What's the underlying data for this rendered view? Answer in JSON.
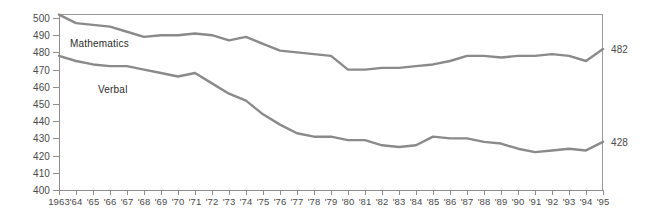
{
  "chart_data": {
    "type": "line",
    "title": "",
    "subtitle": "",
    "xlabel": "",
    "ylabel": "",
    "grid": false,
    "legend_position": "inline-labels",
    "ylim": [
      400,
      505
    ],
    "y_ticks": [
      400,
      410,
      420,
      430,
      440,
      450,
      460,
      470,
      480,
      490,
      500
    ],
    "x": [
      1963,
      1964,
      1965,
      1966,
      1967,
      1968,
      1969,
      1970,
      1971,
      1972,
      1973,
      1974,
      1975,
      1976,
      1977,
      1978,
      1979,
      1980,
      1981,
      1982,
      1983,
      1984,
      1985,
      1986,
      1987,
      1988,
      1989,
      1990,
      1991,
      1992,
      1993,
      1994,
      1995
    ],
    "x_tick_labels": [
      "1963",
      "'64",
      "'65",
      "'66",
      "'67",
      "'68",
      "'69",
      "'70",
      "'71",
      "'72",
      "'73",
      "'74",
      "'75",
      "'76",
      "'77",
      "'78",
      "'79",
      "'80",
      "'81",
      "'82",
      "'83",
      "'84",
      "'85",
      "'86",
      "'87",
      "'88",
      "'89",
      "'90",
      "'91",
      "'92",
      "'93",
      "'94",
      "'95"
    ],
    "series": [
      {
        "name": "Mathematics",
        "color": "#8a8a8a",
        "label_text": "Mathematics",
        "end_value_label": "482",
        "values": [
          502,
          497,
          496,
          495,
          492,
          489,
          490,
          490,
          491,
          490,
          487,
          489,
          485,
          481,
          480,
          479,
          478,
          470,
          470,
          471,
          471,
          472,
          473,
          475,
          478,
          478,
          477,
          478,
          478,
          479,
          478,
          475,
          482
        ]
      },
      {
        "name": "Verbal",
        "color": "#8a8a8a",
        "label_text": "Verbal",
        "end_value_label": "428",
        "values": [
          478,
          475,
          473,
          472,
          472,
          470,
          468,
          466,
          468,
          462,
          456,
          452,
          444,
          438,
          433,
          431,
          431,
          429,
          429,
          426,
          425,
          426,
          431,
          430,
          430,
          428,
          427,
          424,
          422,
          423,
          424,
          423,
          428
        ]
      }
    ]
  }
}
